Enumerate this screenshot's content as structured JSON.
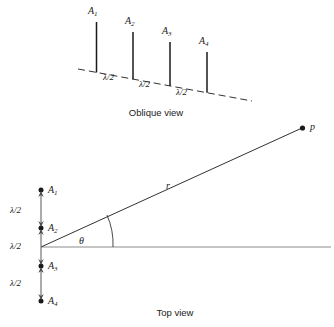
{
  "figure": {
    "width": 334,
    "height": 327,
    "background": "#ffffff",
    "stroke_color": "#1a1a1a",
    "axis_color": "#8c8c8c"
  },
  "oblique_view": {
    "caption": "Oblique view",
    "element_labels": [
      "A₁",
      "A₂",
      "A₃",
      "A₄"
    ],
    "elements": [
      {
        "label_main": "A",
        "label_sub": "1"
      },
      {
        "label_main": "A",
        "label_sub": "2"
      },
      {
        "label_main": "A",
        "label_sub": "3"
      },
      {
        "label_main": "A",
        "label_sub": "4"
      }
    ],
    "spacing_labels": [
      "λ/2",
      "λ/2",
      "λ/2"
    ]
  },
  "top_view": {
    "caption": "Top view",
    "element_labels": [
      "A₁",
      "A₂",
      "A₃",
      "A₄"
    ],
    "elements": [
      {
        "label_main": "A",
        "label_sub": "1"
      },
      {
        "label_main": "A",
        "label_sub": "2"
      },
      {
        "label_main": "A",
        "label_sub": "3"
      },
      {
        "label_main": "A",
        "label_sub": "4"
      }
    ],
    "spacing_labels": [
      "λ/2",
      "λ/2",
      "λ/2"
    ],
    "range_label": "r",
    "angle_label": "θ",
    "field_point_label": "p"
  }
}
